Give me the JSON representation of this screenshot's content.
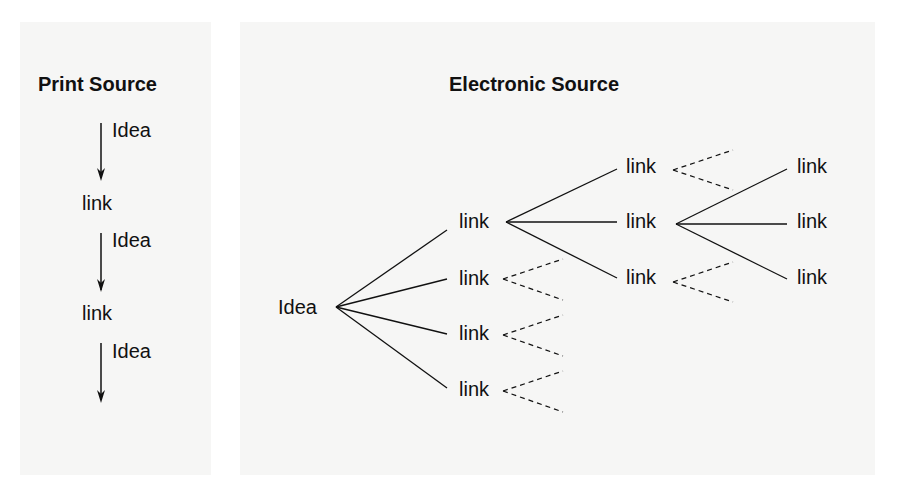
{
  "print_source": {
    "title": "Print Source",
    "steps": [
      {
        "kind": "edge",
        "label": "Idea"
      },
      {
        "kind": "node",
        "label": "link"
      },
      {
        "kind": "edge",
        "label": "Idea"
      },
      {
        "kind": "node",
        "label": "link"
      },
      {
        "kind": "edge",
        "label": "Idea"
      }
    ]
  },
  "electronic_source": {
    "title": "Electronic Source",
    "root": "Idea",
    "level1": [
      "link",
      "link",
      "link",
      "link"
    ],
    "level2": [
      "link",
      "link",
      "link"
    ],
    "level3": [
      "link",
      "link",
      "link"
    ]
  },
  "colors": {
    "panel_bg": "#f6f6f5",
    "ink": "#111111"
  }
}
